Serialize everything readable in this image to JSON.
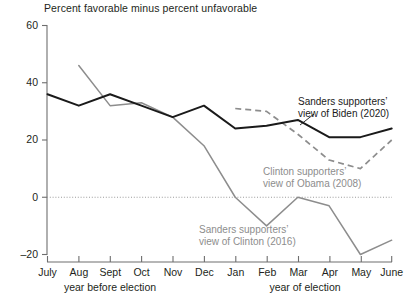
{
  "chart_data": {
    "type": "line",
    "title": "Percent favorable minus percent unfavorable",
    "xlabel": "",
    "ylabel": "",
    "ylim": [
      -20,
      60
    ],
    "yticks": [
      60,
      40,
      20,
      0,
      -20
    ],
    "ytick_labels": [
      "60",
      "40",
      "20",
      "0",
      "–20"
    ],
    "categories": [
      "July",
      "Aug",
      "Sept",
      "Oct",
      "Nov",
      "Dec",
      "Jan",
      "Feb",
      "Mar",
      "Apr",
      "May",
      "June"
    ],
    "grid": false,
    "zero_line": true,
    "legend_position": "inline-annotations",
    "x_group_labels": [
      {
        "text": "year before election",
        "span": [
          "July",
          "Dec"
        ]
      },
      {
        "text": "year of election",
        "span": [
          "Jan",
          "June"
        ]
      }
    ],
    "series": [
      {
        "name": "Sanders supporters’ view of Biden (2020)",
        "style": "solid",
        "color": "#1a1a1a",
        "x": [
          "July",
          "Aug",
          "Sept",
          "Oct",
          "Nov",
          "Dec",
          "Jan",
          "Feb",
          "Mar",
          "Apr",
          "May",
          "June"
        ],
        "values": [
          36,
          32,
          36,
          32,
          28,
          32,
          24,
          25,
          27,
          21,
          21,
          24
        ]
      },
      {
        "name": "Sanders supporters’ view of Clinton (2016)",
        "style": "solid",
        "color": "#8d8d8d",
        "x": [
          "Aug",
          "Sept",
          "Oct",
          "Nov",
          "Dec",
          "Jan",
          "Feb",
          "Mar",
          "Apr",
          "May",
          "June"
        ],
        "values": [
          46,
          32,
          33,
          28,
          18,
          0,
          -10,
          0,
          -3,
          -20,
          -15
        ]
      },
      {
        "name": "Clinton supporters’ view of Obama (2008)",
        "style": "dashed",
        "color": "#8d8d8d",
        "x": [
          "Jan",
          "Feb",
          "Mar",
          "Apr",
          "May",
          "June"
        ],
        "values": [
          31,
          30,
          22,
          13,
          10,
          20
        ]
      }
    ],
    "annotations": [
      {
        "id": "annot-biden",
        "line1": "Sanders supporters’",
        "line2": "view of Biden (2020)",
        "color": "#1a1a1a"
      },
      {
        "id": "annot-obama",
        "line1": "Clinton supporters’",
        "line2": "view of Obama (2008)",
        "color": "#8d8d8d"
      },
      {
        "id": "annot-clinton",
        "line1": "Sanders supporters’",
        "line2": "view of Clinton (2016)",
        "color": "#8d8d8d"
      }
    ]
  },
  "axis": {
    "y0": "60",
    "y1": "40",
    "y2": "20",
    "y3": "0",
    "y4": "–20",
    "x0": "July",
    "x1": "Aug",
    "x2": "Sept",
    "x3": "Oct",
    "x4": "Nov",
    "x5": "Dec",
    "x6": "Jan",
    "x7": "Feb",
    "x8": "Mar",
    "x9": "Apr",
    "x10": "May",
    "x11": "June",
    "group_before": "year before election",
    "group_of": "year of election"
  },
  "colors": {
    "dark_line": "#1a1a1a",
    "grey_line": "#8d8d8d",
    "axis": "#6e6e6e",
    "text": "#231f20"
  }
}
